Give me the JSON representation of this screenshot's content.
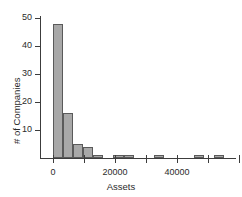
{
  "chart_data": {
    "type": "bar",
    "title": "",
    "subtitle": "",
    "xlabel": "Assets",
    "ylabel": "# of Companies",
    "xlim": [
      -4000,
      62000
    ],
    "ylim": [
      0,
      52
    ],
    "grid": false,
    "legend": null,
    "bin_width": 3250,
    "x_ticks": [
      {
        "value": 0,
        "label": "0",
        "labeled": true
      },
      {
        "value": 10000,
        "label": "",
        "labeled": false
      },
      {
        "value": 20000,
        "label": "20000",
        "labeled": true
      },
      {
        "value": 30000,
        "label": "",
        "labeled": false
      },
      {
        "value": 40000,
        "label": "40000",
        "labeled": true
      },
      {
        "value": 50000,
        "label": "",
        "labeled": false
      },
      {
        "value": 60000,
        "label": "",
        "labeled": false
      }
    ],
    "y_ticks": [
      {
        "value": 10,
        "label": "10"
      },
      {
        "value": 20,
        "label": "20"
      },
      {
        "value": 30,
        "label": "30"
      },
      {
        "value": 40,
        "label": "40"
      },
      {
        "value": 50,
        "label": "50"
      }
    ],
    "bins": [
      {
        "x0": 0,
        "x1": 3250,
        "value": 48
      },
      {
        "x0": 3250,
        "x1": 6500,
        "value": 16
      },
      {
        "x0": 6500,
        "x1": 9750,
        "value": 5
      },
      {
        "x0": 9750,
        "x1": 13000,
        "value": 4
      },
      {
        "x0": 13000,
        "x1": 16250,
        "value": 1
      },
      {
        "x0": 16250,
        "x1": 19500,
        "value": 0
      },
      {
        "x0": 19500,
        "x1": 22750,
        "value": 1
      },
      {
        "x0": 22750,
        "x1": 26000,
        "value": 1
      },
      {
        "x0": 26000,
        "x1": 29250,
        "value": 0
      },
      {
        "x0": 29250,
        "x1": 32500,
        "value": 0
      },
      {
        "x0": 32500,
        "x1": 35750,
        "value": 1
      },
      {
        "x0": 35750,
        "x1": 39000,
        "value": 0
      },
      {
        "x0": 39000,
        "x1": 42250,
        "value": 0
      },
      {
        "x0": 42250,
        "x1": 45500,
        "value": 0
      },
      {
        "x0": 45500,
        "x1": 48750,
        "value": 1
      },
      {
        "x0": 48750,
        "x1": 52000,
        "value": 0
      },
      {
        "x0": 52000,
        "x1": 55250,
        "value": 1
      }
    ],
    "categories": [
      "0-3250",
      "3250-6500",
      "6500-9750",
      "9750-13000",
      "13000-16250",
      "16250-19500",
      "19500-22750",
      "22750-26000",
      "26000-29250",
      "29250-32500",
      "32500-35750",
      "35750-39000",
      "39000-42250",
      "42250-45500",
      "45500-48750",
      "48750-52000",
      "52000-55250"
    ],
    "values": [
      48,
      16,
      5,
      4,
      1,
      0,
      1,
      1,
      0,
      0,
      1,
      0,
      0,
      0,
      1,
      0,
      1
    ],
    "colors": {
      "bar_fill": "#a8a8a8",
      "bar_stroke": "#5a5a5a",
      "axis": "#3c3c3c",
      "text": "#2b2b2b",
      "background": "#ffffff"
    }
  }
}
